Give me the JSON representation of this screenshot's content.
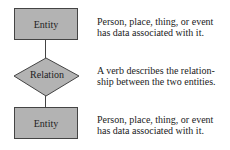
{
  "diagram": {
    "nodes": [
      {
        "type": "entity",
        "label": "Entity",
        "description": [
          "Person, place, thing, or event",
          "has data associated with it."
        ]
      },
      {
        "type": "relation",
        "label": "Relation",
        "description": [
          "A verb describes the relation-",
          "ship between the two entities."
        ]
      },
      {
        "type": "entity",
        "label": "Entity",
        "description": [
          "Person, place, thing, or event",
          "has data associated with it."
        ]
      }
    ],
    "colors": {
      "fill": "#b3b3b3",
      "stroke": "#444444"
    }
  }
}
